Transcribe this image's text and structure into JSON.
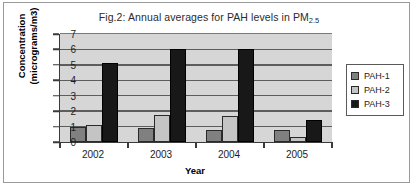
{
  "figure": {
    "title_prefix": "Fig.2: Annual averages for PAH levels in PM",
    "title_subscript": "2.5"
  },
  "chart_data": {
    "type": "bar",
    "title": "Fig.2: Annual averages for PAH levels in PM2.5",
    "xlabel": "Year",
    "ylabel": "Concentration (micrograms/m3)",
    "ylabel_line1": "Concentration",
    "ylabel_line2": "(micrograms/m3)",
    "categories": [
      "2002",
      "2003",
      "2004",
      "2005"
    ],
    "yticks": [
      "0",
      "1",
      "2",
      "3",
      "4",
      "5",
      "6",
      "7"
    ],
    "ylim": [
      0,
      7
    ],
    "grid": true,
    "legend_position": "right",
    "series": [
      {
        "name": "PAH-1",
        "color": "#808080",
        "values": [
          1.0,
          0.9,
          0.75,
          0.8
        ]
      },
      {
        "name": "PAH-2",
        "color": "#c4c4c4",
        "values": [
          1.1,
          1.75,
          1.7,
          0.3
        ]
      },
      {
        "name": "PAH-3",
        "color": "#181818",
        "values": [
          5.1,
          6.05,
          6.0,
          1.45
        ]
      }
    ]
  }
}
